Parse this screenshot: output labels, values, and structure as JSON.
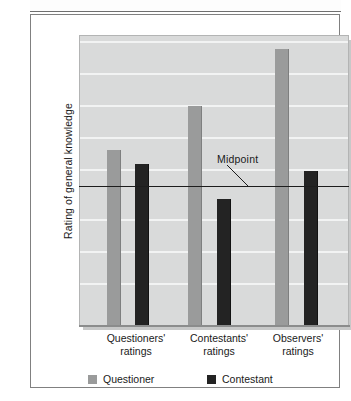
{
  "figure": {
    "ytitle": "Rating of general knowledge",
    "midpoint_annotation": "Midpoint"
  },
  "legend": {
    "items": [
      {
        "label": "Questioner",
        "color": "#9a9b9b",
        "swatch": "questioner-swatch"
      },
      {
        "label": "Contestant",
        "color": "#232323",
        "swatch": "contestant-swatch"
      }
    ]
  },
  "xaxis": {
    "labels": [
      {
        "line1": "Questioners'",
        "line2": "ratings"
      },
      {
        "line1": "Contestants'",
        "line2": "ratings"
      },
      {
        "line1": "Observers'",
        "line2": "ratings"
      }
    ]
  },
  "chart_data": {
    "type": "bar",
    "title": "",
    "xlabel": "",
    "ylabel": "Rating of general knowledge",
    "categories": [
      "Questioners' ratings",
      "Contestants' ratings",
      "Observers' ratings"
    ],
    "series": [
      {
        "name": "Questioner",
        "color": "#9a9b9b",
        "values": [
          54,
          69,
          88
        ]
      },
      {
        "name": "Contestant",
        "color": "#232323",
        "values": [
          49,
          37,
          47
        ]
      }
    ],
    "ylim": [
      0,
      100
    ],
    "yticks": [],
    "grid": true,
    "gridline_count": 8,
    "legend_position": "below",
    "annotations": [
      {
        "text": "Midpoint",
        "type": "reference-line-label",
        "value": 48
      }
    ],
    "reference_lines": [
      {
        "label": "Midpoint",
        "value": 48,
        "color": "#1d1d1d",
        "orientation": "horizontal"
      }
    ]
  },
  "geometry": {
    "plot": {
      "left": 48,
      "top": 20,
      "width": 270,
      "height": 291
    },
    "midline_top": 171,
    "gridline_tops": [
      25,
      57,
      89,
      121,
      153,
      203,
      235,
      267
    ],
    "bars": [
      {
        "series": "Questioner",
        "group": 0,
        "left": 27,
        "top": 134,
        "width": 14
      },
      {
        "series": "Contestant",
        "group": 0,
        "left": 55,
        "top": 148,
        "width": 14
      },
      {
        "series": "Questioner",
        "group": 1,
        "left": 108,
        "top": 90,
        "width": 14
      },
      {
        "series": "Contestant",
        "group": 1,
        "left": 137,
        "top": 183,
        "width": 14
      },
      {
        "series": "Questioner",
        "group": 2,
        "left": 195,
        "top": 33,
        "width": 14
      },
      {
        "series": "Contestant",
        "group": 2,
        "left": 224,
        "top": 155,
        "width": 14
      }
    ],
    "xlabel_lefts": [
      9,
      92,
      171
    ],
    "legend_lefts": [
      9,
      128
    ]
  }
}
